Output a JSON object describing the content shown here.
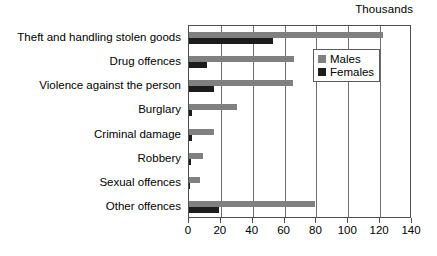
{
  "chart_data": {
    "type": "bar",
    "orientation": "horizontal",
    "title": "",
    "units_label": "Thousands",
    "xlabel": "",
    "ylabel": "",
    "xlim": [
      0,
      140
    ],
    "xticks": [
      0,
      20,
      40,
      60,
      80,
      100,
      120,
      140
    ],
    "grid": true,
    "grid_axis": "x",
    "legend_position": "upper right",
    "categories": [
      "Theft and handling stolen goods",
      "Drug offences",
      "Violence against the person",
      "Burglary",
      "Criminal damage",
      "Robbery",
      "Sexual offences",
      "Other offences"
    ],
    "series": [
      {
        "name": "Males",
        "color": "#808080",
        "values": [
          122,
          66,
          65,
          30,
          16,
          9,
          7,
          79
        ]
      },
      {
        "name": "Females",
        "color": "#1c1c1c",
        "values": [
          53,
          11,
          16,
          2,
          2,
          1,
          0.5,
          19
        ]
      }
    ]
  },
  "legend": {
    "items": [
      {
        "label": "Males"
      },
      {
        "label": "Females"
      }
    ]
  }
}
